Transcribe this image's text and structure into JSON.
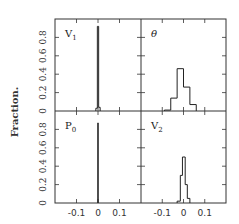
{
  "chart_data": {
    "type": "bar",
    "title": "",
    "ylabel": "Fraction.",
    "xlabel": "",
    "layout": {
      "rows": 2,
      "cols": 2,
      "shared_axes": true
    },
    "xlim": [
      -0.2,
      0.2
    ],
    "ylim": [
      0,
      1.0
    ],
    "x_ticks": [
      -0.1,
      0,
      0.1
    ],
    "x_tick_labels": [
      "-0.1",
      "0",
      "0.1"
    ],
    "y_ticks": [
      0,
      0.2,
      0.4,
      0.6,
      0.8
    ],
    "y_tick_labels": [
      "0",
      "0.2",
      "0.4",
      "0.6",
      "0.8"
    ],
    "grid": false,
    "panels": [
      {
        "name": "V1",
        "label_main": "V",
        "label_sub": "1",
        "position": "top-left",
        "bins": [
          {
            "x0": -0.01,
            "x1": -0.003,
            "value": 0.03
          },
          {
            "x0": -0.003,
            "x1": 0.003,
            "value": 0.92
          },
          {
            "x0": 0.003,
            "x1": 0.01,
            "value": 0.04
          }
        ]
      },
      {
        "name": "theta",
        "label_main": "θ",
        "label_sub": "",
        "position": "top-right",
        "bins": [
          {
            "x0": -0.09,
            "x1": -0.06,
            "value": 0.01
          },
          {
            "x0": -0.06,
            "x1": -0.03,
            "value": 0.14
          },
          {
            "x0": -0.03,
            "x1": 0.0,
            "value": 0.46
          },
          {
            "x0": 0.0,
            "x1": 0.03,
            "value": 0.26
          },
          {
            "x0": 0.03,
            "x1": 0.06,
            "value": 0.07
          }
        ]
      },
      {
        "name": "P0",
        "label_main": "P",
        "label_sub": "0",
        "position": "bottom-left",
        "bins": [
          {
            "x0": -0.001,
            "x1": 0.001,
            "value": 0.87
          }
        ]
      },
      {
        "name": "V2",
        "label_main": "V",
        "label_sub": "2",
        "position": "bottom-right",
        "bins": [
          {
            "x0": -0.03,
            "x1": -0.015,
            "value": 0.02
          },
          {
            "x0": -0.015,
            "x1": -0.005,
            "value": 0.3
          },
          {
            "x0": -0.005,
            "x1": 0.008,
            "value": 0.5
          },
          {
            "x0": 0.008,
            "x1": 0.018,
            "value": 0.2
          },
          {
            "x0": 0.018,
            "x1": 0.03,
            "value": 0.05
          }
        ]
      }
    ]
  }
}
